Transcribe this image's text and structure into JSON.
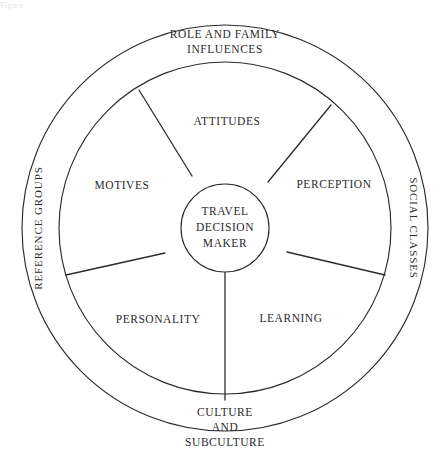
{
  "figure": {
    "cropped_caption_fragment": "Figure",
    "center": {
      "x": 225,
      "y": 228
    },
    "radii": {
      "outer": 203,
      "middle": 166,
      "inner": 44
    },
    "stroke_color": "#2b2b2b",
    "background_color": "#ffffff"
  },
  "core": {
    "name": "travel-decision-maker",
    "lines": [
      "TRAVEL",
      "DECISION",
      "MAKER"
    ],
    "text": "TRAVEL DECISION MAKER"
  },
  "inner_ring": {
    "description": "Internal psychological variables of the travel decision maker",
    "segments": [
      {
        "id": "attitudes",
        "label": "ATTITUDES",
        "label_x": 227,
        "label_y": 122
      },
      {
        "id": "perception",
        "label": "PERCEPTION",
        "label_x": 334,
        "label_y": 185
      },
      {
        "id": "learning",
        "label": "LEARNING",
        "label_x": 291,
        "label_y": 319
      },
      {
        "id": "personality",
        "label": "PERSONALITY",
        "label_x": 158,
        "label_y": 320
      },
      {
        "id": "motives",
        "label": "MOTIVES",
        "label_x": 122,
        "label_y": 186
      }
    ],
    "spokes": [
      {
        "id": "spoke-upper-left",
        "x1": 192,
        "y1": 176,
        "x2": 139,
        "y2": 90
      },
      {
        "id": "spoke-upper-right",
        "x1": 268,
        "y1": 182,
        "x2": 331,
        "y2": 105
      },
      {
        "id": "spoke-right",
        "x1": 287,
        "y1": 252,
        "x2": 385,
        "y2": 275
      },
      {
        "id": "spoke-bottom",
        "x1": 225,
        "y1": 272,
        "x2": 225,
        "y2": 400
      },
      {
        "id": "spoke-left",
        "x1": 165,
        "y1": 253,
        "x2": 66,
        "y2": 275
      }
    ]
  },
  "outer_ring": {
    "description": "External social influences on the travel decision maker",
    "labels": [
      {
        "id": "role-and-family-influences",
        "lines": [
          "ROLE AND FAMILY",
          "INFLUENCES"
        ],
        "text": "ROLE AND FAMILY INFLUENCES",
        "position": "top",
        "orientation": "horizontal",
        "label_x": 225,
        "label_y": 42
      },
      {
        "id": "social-classes",
        "lines": [
          "SOCIAL CLASSES"
        ],
        "text": "SOCIAL CLASSES",
        "position": "right",
        "orientation": "vertical-down",
        "label_x": 414,
        "label_y": 228
      },
      {
        "id": "culture-and-subculture",
        "lines": [
          "CULTURE",
          "AND",
          "SUBCULTURE"
        ],
        "text": "CULTURE AND SUBCULTURE",
        "position": "bottom",
        "orientation": "horizontal",
        "label_x": 225,
        "label_y": 428
      },
      {
        "id": "reference-groups",
        "lines": [
          "REFERENCE GROUPS"
        ],
        "text": "REFERENCE GROUPS",
        "position": "left",
        "orientation": "vertical-up",
        "label_x": 38,
        "label_y": 228
      }
    ]
  }
}
